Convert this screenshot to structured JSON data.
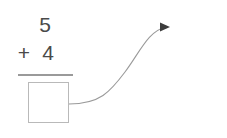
{
  "page": {
    "background_color": "#ffffff",
    "ink_color": "#4a4a4a",
    "rule_color": "#9a9a9a",
    "box_border_color": "#b9b9b9"
  },
  "left_problem": {
    "name": "addition-problem",
    "top_addend": "5",
    "operator": "+",
    "bottom_addend": "4",
    "answer": "",
    "answer_placeholder": ""
  },
  "right_problem": {
    "name": "subtraction-problem",
    "minuend": "",
    "minuend_placeholder": "",
    "operator": "−",
    "subtrahend": "2",
    "answer": "",
    "answer_placeholder": ""
  },
  "connector": {
    "name": "carry-result-arrow",
    "from": "addition-answer-box",
    "to": "subtraction-minuend-box",
    "color": "#9a9a9a",
    "arrowhead_color": "#3c3c3c"
  }
}
